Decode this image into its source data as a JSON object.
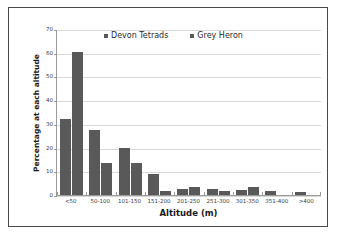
{
  "chart_data": {
    "type": "bar",
    "title": "",
    "xlabel": "Altitude (m)",
    "ylabel": "Percentage at each altitude",
    "ylim": [
      0,
      70
    ],
    "yticks": [
      0,
      10,
      20,
      30,
      40,
      50,
      60,
      70
    ],
    "grid": true,
    "legend_position": "top-center",
    "bar_color": "#595959",
    "gridline_color": "#d9d9d9",
    "axis_color": "#9a9a9a",
    "categories": [
      "<50",
      "50-100",
      "101-150",
      "151-200",
      "201-250",
      "251-300",
      "301-350",
      "351-400",
      ">400"
    ],
    "series": [
      {
        "name": "Devon Tetrads",
        "values": [
          32,
          27.5,
          20,
          9,
          2.5,
          2.5,
          2,
          1.5,
          1.2
        ]
      },
      {
        "name": "Grey Heron",
        "values": [
          60.5,
          13.5,
          13.5,
          1.8,
          3.5,
          1.5,
          3.5,
          0,
          0
        ]
      }
    ]
  }
}
